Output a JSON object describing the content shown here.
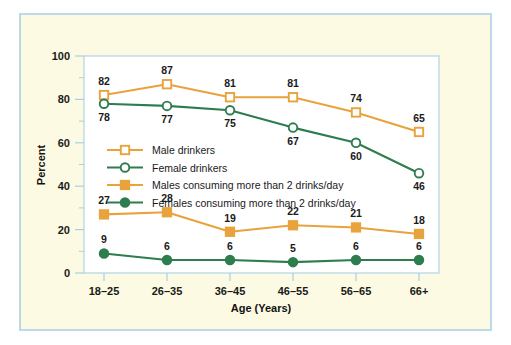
{
  "figure": {
    "background_color": "#fcfae3",
    "border_color": "#bcd9ea",
    "plot_background_color": "#ffffff"
  },
  "chart_data": {
    "type": "line",
    "title": "",
    "xlabel": "Age (Years)",
    "ylabel": "Percent",
    "categories": [
      "18–25",
      "26–35",
      "36–45",
      "46–55",
      "56–65",
      "66+"
    ],
    "ylim": [
      0,
      100
    ],
    "yticks": [
      0,
      20,
      40,
      60,
      80,
      100
    ],
    "ytick_labels": [
      "0",
      "20",
      "40",
      "60",
      "80",
      "100"
    ],
    "minor_ytick_step": 10,
    "grid": false,
    "legend_position": "center-left",
    "series": [
      {
        "name": "Male drinkers",
        "color": "#e8a33d",
        "marker": "open-square",
        "values": [
          82,
          87,
          81,
          81,
          74,
          65
        ],
        "label_offsets": [
          "above",
          "above",
          "above",
          "above",
          "above",
          "above"
        ]
      },
      {
        "name": "Female drinkers",
        "color": "#2e7d4f",
        "marker": "open-circle",
        "values": [
          78,
          77,
          75,
          67,
          60,
          46
        ],
        "label_offsets": [
          "below",
          "below",
          "below",
          "below",
          "below",
          "below"
        ]
      },
      {
        "name": "Males consuming more than 2 drinks/day",
        "color": "#e8a33d",
        "marker": "filled-square",
        "values": [
          27,
          28,
          19,
          22,
          21,
          18
        ],
        "label_offsets": [
          "above",
          "above",
          "above",
          "above",
          "above",
          "above"
        ]
      },
      {
        "name": "Females consuming more than 2 drinks/day",
        "color": "#2e7d4f",
        "marker": "filled-circle",
        "values": [
          9,
          6,
          6,
          5,
          6,
          6
        ],
        "label_offsets": [
          "above",
          "above",
          "above",
          "above",
          "above",
          "above"
        ]
      }
    ]
  }
}
